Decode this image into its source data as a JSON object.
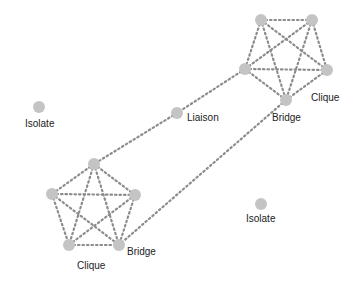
{
  "diagram": {
    "type": "social-network",
    "colors": {
      "node": "#c4c4c4",
      "edge": "#8c8c8c",
      "label": "#222222"
    },
    "nodes": [
      {
        "id": "c1a",
        "x": 261,
        "y": 20
      },
      {
        "id": "c1b",
        "x": 312,
        "y": 20
      },
      {
        "id": "c1c",
        "x": 245,
        "y": 69
      },
      {
        "id": "c1d",
        "x": 327,
        "y": 70
      },
      {
        "id": "c1e",
        "x": 286,
        "y": 100
      },
      {
        "id": "c2a",
        "x": 94,
        "y": 164
      },
      {
        "id": "c2b",
        "x": 52,
        "y": 194
      },
      {
        "id": "c2c",
        "x": 135,
        "y": 195
      },
      {
        "id": "c2d",
        "x": 69,
        "y": 245
      },
      {
        "id": "c2e",
        "x": 119,
        "y": 245
      },
      {
        "id": "liaison",
        "x": 177,
        "y": 113
      },
      {
        "id": "iso1",
        "x": 39,
        "y": 107
      },
      {
        "id": "iso2",
        "x": 261,
        "y": 204
      }
    ],
    "edges": [
      [
        "c1a",
        "c1b"
      ],
      [
        "c1a",
        "c1c"
      ],
      [
        "c1a",
        "c1d"
      ],
      [
        "c1a",
        "c1e"
      ],
      [
        "c1b",
        "c1c"
      ],
      [
        "c1b",
        "c1d"
      ],
      [
        "c1b",
        "c1e"
      ],
      [
        "c1c",
        "c1d"
      ],
      [
        "c1c",
        "c1e"
      ],
      [
        "c1d",
        "c1e"
      ],
      [
        "c2a",
        "c2b"
      ],
      [
        "c2a",
        "c2c"
      ],
      [
        "c2a",
        "c2d"
      ],
      [
        "c2a",
        "c2e"
      ],
      [
        "c2b",
        "c2c"
      ],
      [
        "c2b",
        "c2d"
      ],
      [
        "c2b",
        "c2e"
      ],
      [
        "c2c",
        "c2d"
      ],
      [
        "c2c",
        "c2e"
      ],
      [
        "c2d",
        "c2e"
      ],
      [
        "c1c",
        "liaison"
      ],
      [
        "liaison",
        "c2a"
      ],
      [
        "c1e",
        "c2e"
      ]
    ],
    "labels": {
      "isolate_left": "Isolate",
      "liaison": "Liaison",
      "clique_top": "Clique",
      "bridge_top": "Bridge",
      "isolate_right": "Isolate",
      "bridge_bottom": "Bridge",
      "clique_bottom": "Clique"
    }
  }
}
